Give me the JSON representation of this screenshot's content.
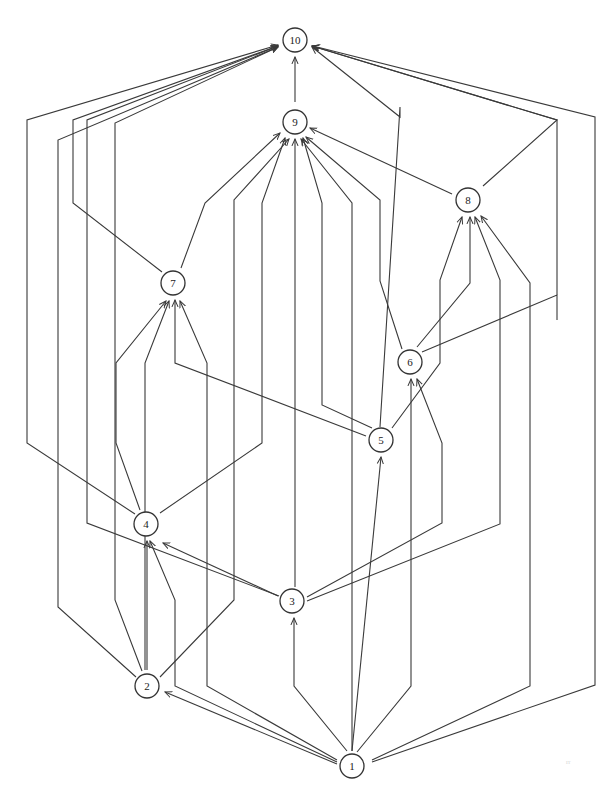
{
  "diagram": {
    "type": "directed-acyclic-graph",
    "colors": {
      "stroke": "#3a3a3a",
      "node_fill": "#ffffff",
      "background": "#ffffff"
    },
    "nodes": [
      {
        "id": "1",
        "label": "1",
        "x": 352,
        "y": 766
      },
      {
        "id": "2",
        "label": "2",
        "x": 147,
        "y": 686
      },
      {
        "id": "3",
        "label": "3",
        "x": 292,
        "y": 601
      },
      {
        "id": "4",
        "label": "4",
        "x": 146,
        "y": 524
      },
      {
        "id": "5",
        "label": "5",
        "x": 381,
        "y": 440
      },
      {
        "id": "6",
        "label": "6",
        "x": 410,
        "y": 362
      },
      {
        "id": "7",
        "label": "7",
        "x": 173,
        "y": 283
      },
      {
        "id": "8",
        "label": "8",
        "x": 468,
        "y": 200
      },
      {
        "id": "9",
        "label": "9",
        "x": 295,
        "y": 122
      },
      {
        "id": "10",
        "label": "10",
        "x": 295,
        "y": 40
      }
    ],
    "edges": [
      {
        "from": "9",
        "to": "10",
        "points": "295,102 295,57"
      },
      {
        "from": "2",
        "to": "10",
        "points": "136,677 58,607 58,140 278,47"
      },
      {
        "from": "4",
        "to": "10",
        "points": "135,514 27,443 27,120 278,45"
      },
      {
        "from": "3",
        "to": "10",
        "points": "279,596 87,523 87,120 278,46"
      },
      {
        "from": "7",
        "to": "10",
        "points": "162,272 73,203 73,120 278,46"
      },
      {
        "from": "2",
        "to": "7",
        "points": "142,671 115,600 115,123 278,47"
      },
      {
        "from": "5",
        "to": "10",
        "points": "380,427 400,107 400,117 312,47"
      },
      {
        "from": "8",
        "to": "10",
        "points": "483,186 557,120 312,46"
      },
      {
        "from": "6",
        "to": "10",
        "points": "422,352 557,295 557,320 557,120 312,46"
      },
      {
        "from": "1",
        "to": "10",
        "points": "372,762 595,685 595,117 313,46"
      },
      {
        "from": "7",
        "to": "9",
        "points": "181,268 205,203 280,133"
      },
      {
        "from": "4",
        "to": "9",
        "points": "160,513 262,443 262,203 285,138"
      },
      {
        "from": "2",
        "to": "9",
        "points": "160,677 234,600 234,200 289,139"
      },
      {
        "from": "3",
        "to": "9",
        "points": "295,587 295,139"
      },
      {
        "from": "1",
        "to": "9",
        "points": "352,751 352,203 301,139"
      },
      {
        "from": "5",
        "to": "9",
        "points": "372,428 322,405 322,203 303,138"
      },
      {
        "from": "6",
        "to": "9",
        "points": "402,349 380,281 380,200 306,137"
      },
      {
        "from": "8",
        "to": "9",
        "points": "452,194 310,128"
      },
      {
        "from": "5",
        "to": "7",
        "points": "366,436 175,363 175,300"
      },
      {
        "from": "4",
        "to": "7",
        "points": "140,510 116,443 116,363 166,301"
      },
      {
        "from": "2",
        "to": "7",
        "points": "145,670 145,563 145,363 169,301"
      },
      {
        "from": "1",
        "to": "7",
        "points": "337,760 207,686 207,363 180,301"
      },
      {
        "from": "2",
        "to": "4",
        "points": "147,670 147,541"
      },
      {
        "from": "1",
        "to": "4",
        "points": "337,762 175,686 175,600 150,541"
      },
      {
        "from": "3",
        "to": "4",
        "points": "278,596 163,543"
      },
      {
        "from": "1",
        "to": "2",
        "points": "337,764 165,692"
      },
      {
        "from": "1",
        "to": "3",
        "points": "347,751 294,686 294,618"
      },
      {
        "from": "1",
        "to": "5",
        "points": "352,751 381,457"
      },
      {
        "from": "1",
        "to": "6",
        "points": "357,752 411,686 411,379"
      },
      {
        "from": "3",
        "to": "6",
        "points": "307,597 442,523 442,443 417,379"
      },
      {
        "from": "5",
        "to": "6",
        "points": "392,428 440,363 440,280 462,217"
      },
      {
        "from": "6",
        "to": "8",
        "points": "417,347 470,283 470,217"
      },
      {
        "from": "3",
        "to": "8",
        "points": "307,601 500,524 500,280 475,217"
      },
      {
        "from": "1",
        "to": "8",
        "points": "372,760 530,686 530,283 481,216"
      }
    ],
    "artifact_text": "rr"
  }
}
